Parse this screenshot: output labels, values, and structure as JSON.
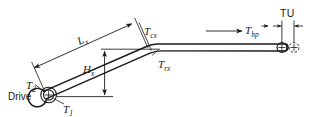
{
  "diagram": {
    "stroke_color": "#1a1a1a",
    "background_color": "#ffffff",
    "labels": {
      "drive": "Drive",
      "t1": "T",
      "t1_sub": "1",
      "t2": "T",
      "t2_sub": "2",
      "lx": "L",
      "lx_sub": "x",
      "hx": "H",
      "hx_sub": "x",
      "tcx": "T",
      "tcx_sub": "cx",
      "trx": "T",
      "trx_sub": "rx",
      "thp": "T",
      "thp_sub": "hp",
      "tu": "TU"
    },
    "elements": {
      "drive_pulley": "drive-pulley",
      "bend_point": "belt-bend-point",
      "tail_pulley": "tail-pulley",
      "takeup_pulley": "takeup-pulley",
      "carry_strand": "carry-side-belt-strand",
      "return_strand": "return-side-belt-strand",
      "lx_dimension": "incline-length-dimension",
      "hx_dimension": "incline-height-dimension",
      "tu_dimension": "takeup-travel-dimension",
      "thp_arrow": "horizontal-pull-arrow"
    }
  }
}
